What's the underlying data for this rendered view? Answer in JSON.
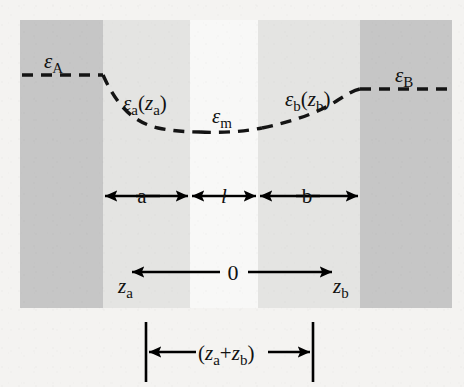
{
  "figure": {
    "width": 464,
    "height": 387,
    "background_color": "#f4f3f1",
    "band_dark_color": "#c6c6c6",
    "band_mid_color": "#e4e4e2",
    "band_light_color": "#f7f7f6",
    "curve_color": "#141414",
    "line_color": "#000000"
  },
  "labels": {
    "eps_A": "ε",
    "eps_A_sub": "A",
    "eps_B": "ε",
    "eps_B_sub": "B",
    "eps_m": "ε",
    "eps_m_sub": "m",
    "eps_a_main": "ε",
    "eps_a_sub": "a",
    "eps_a_arg_open": "(",
    "eps_a_arg": "z",
    "eps_a_arg_sub": "a",
    "eps_a_arg_close": ")",
    "eps_b_main": "ε",
    "eps_b_sub": "b",
    "eps_b_arg_open": "(",
    "eps_b_arg": "z",
    "eps_b_arg_sub": "b",
    "eps_b_arg_close": ")",
    "dim_a": "a",
    "dim_l": "l",
    "dim_b": "b",
    "origin": "0",
    "axis_za": "z",
    "axis_za_sub": "a",
    "axis_zb": "z",
    "axis_zb_sub": "b",
    "total_open": "(",
    "total_za": "z",
    "total_za_sub": "a",
    "total_plus": "+",
    "total_zb": "z",
    "total_zb_sub": "b",
    "total_close": ")"
  },
  "geometry": {
    "bands": [
      {
        "name": "slab-A",
        "x": 20,
        "width": 83,
        "shade": "dark"
      },
      {
        "name": "region-a",
        "x": 103,
        "width": 87,
        "shade": "mid"
      },
      {
        "name": "region-m",
        "x": 190,
        "width": 68,
        "shade": "light"
      },
      {
        "name": "region-b",
        "x": 258,
        "width": 102,
        "shade": "mid"
      },
      {
        "name": "slab-B",
        "x": 360,
        "width": 92,
        "shade": "dark"
      }
    ],
    "band_top": 20,
    "band_bottom": 308,
    "curve_left_y": 75,
    "curve_right_y": 89,
    "curve_bottom_y": 128,
    "dim_row_y": 196,
    "axis_row_y": 272,
    "total_row_y": 352,
    "total_tick_left_x": 145,
    "total_tick_right_x": 313
  }
}
